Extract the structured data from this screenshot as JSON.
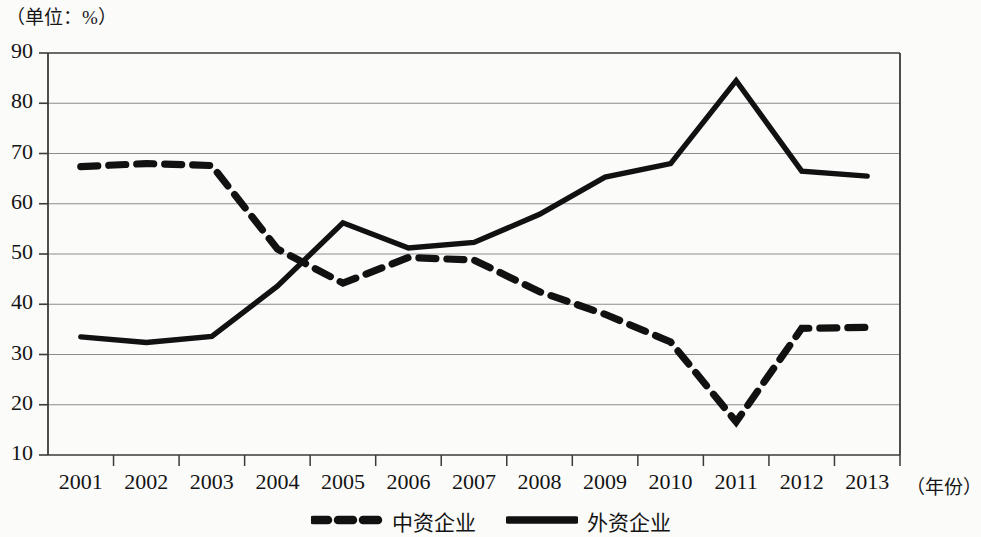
{
  "figure": {
    "unit_label": "（单位：%）",
    "x_axis_unit": "（年份）"
  },
  "legend": {
    "items": [
      {
        "label": "中资企业",
        "style": "dashed",
        "color": "#111111",
        "swatch": "dashed-line-swatch"
      },
      {
        "label": "外资企业",
        "style": "solid",
        "color": "#111111",
        "swatch": "solid-line-swatch"
      }
    ]
  },
  "chart_data": {
    "type": "line",
    "title": "",
    "subtitle": "",
    "xlabel": "（年份）",
    "ylabel": "（单位：%）",
    "grid": true,
    "legend_position": "bottom-center",
    "xlim": [
      "2001",
      "2013"
    ],
    "ylim": [
      10,
      90
    ],
    "ytick_step": 10,
    "yticks": [
      10,
      20,
      30,
      40,
      50,
      60,
      70,
      80,
      90
    ],
    "categories": [
      "2001",
      "2002",
      "2003",
      "2004",
      "2005",
      "2006",
      "2007",
      "2008",
      "2009",
      "2010",
      "2011",
      "2012",
      "2013"
    ],
    "series": [
      {
        "name": "中资企业",
        "style": "dashed",
        "color": "#111111",
        "values": [
          67.4,
          68.0,
          67.6,
          51.0,
          44.2,
          49.3,
          48.8,
          42.5,
          38.0,
          32.5,
          16.6,
          35.2,
          35.4
        ]
      },
      {
        "name": "外资企业",
        "style": "solid",
        "color": "#111111",
        "values": [
          33.5,
          32.4,
          33.6,
          43.6,
          56.2,
          51.2,
          52.3,
          57.9,
          65.3,
          68.0,
          84.5,
          66.5,
          65.5
        ]
      }
    ]
  }
}
